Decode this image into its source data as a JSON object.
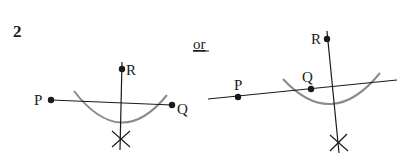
{
  "question_number": "2",
  "separator": "or",
  "colors": {
    "ink": "#1a1a1a",
    "arc": "#8a8a8a",
    "background": "#ffffff"
  },
  "diagrams": [
    {
      "name": "left-construction",
      "points": [
        {
          "label": "P",
          "x": 51,
          "y": 100
        },
        {
          "label": "Q",
          "x": 172,
          "y": 105
        },
        {
          "label": "R",
          "x": 122,
          "y": 69
        }
      ]
    },
    {
      "name": "right-construction",
      "points": [
        {
          "label": "P",
          "x": 238,
          "y": 97
        },
        {
          "label": "Q",
          "x": 311,
          "y": 89
        },
        {
          "label": "R",
          "x": 327,
          "y": 39
        }
      ]
    }
  ]
}
